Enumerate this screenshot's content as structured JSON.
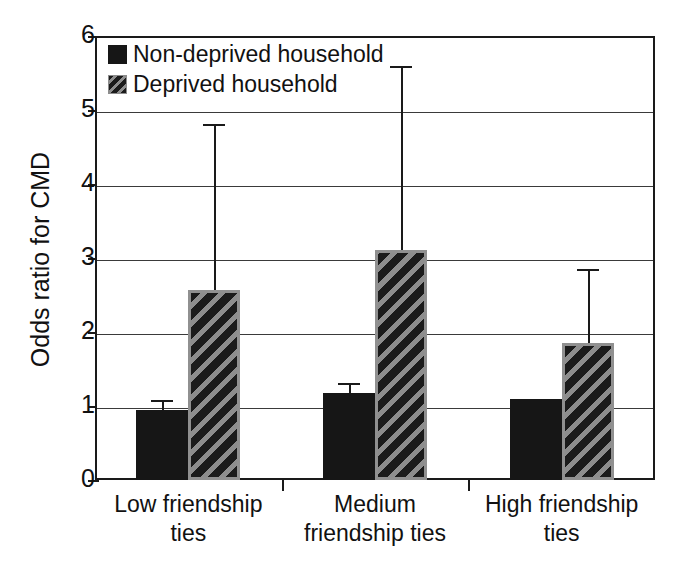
{
  "chart_data": {
    "type": "bar",
    "title": "",
    "subtitle": "",
    "xlabel": "",
    "ylabel": "Odds ratio for CMD",
    "ylim": [
      0,
      6
    ],
    "ytick_labels": [
      "0",
      "1",
      "2",
      "3",
      "4",
      "5",
      "6"
    ],
    "ytick_values": [
      0,
      1,
      2,
      3,
      4,
      5,
      6
    ],
    "grid": "horizontal",
    "legend_position": "top-left",
    "categories": [
      "Low friendship ties",
      "Medium friendship ties",
      "High friendship ties"
    ],
    "category_lines": [
      [
        "Low friendship",
        "ties"
      ],
      [
        "Medium",
        "friendship ties"
      ],
      [
        "High friendship",
        "ties"
      ]
    ],
    "series": [
      {
        "name": "Non-deprived household",
        "fill": "solid-black",
        "color": "#161616",
        "values": [
          0.94,
          1.17,
          1.1
        ],
        "error_upper": [
          1.08,
          1.31,
          1.1
        ]
      },
      {
        "name": "Deprived household",
        "fill": "diagonal-hatch",
        "color": "#1b1b1b",
        "hatch_color": "#8d8d8d",
        "values": [
          2.57,
          3.11,
          1.85
        ],
        "error_upper": [
          4.81,
          5.6,
          2.85
        ]
      }
    ]
  },
  "legend": {
    "items": [
      {
        "label": "Non-deprived household",
        "swatch": "solid"
      },
      {
        "label": "Deprived household",
        "swatch": "hatched"
      }
    ]
  },
  "axis": {
    "y_title": "Odds ratio for CMD"
  }
}
